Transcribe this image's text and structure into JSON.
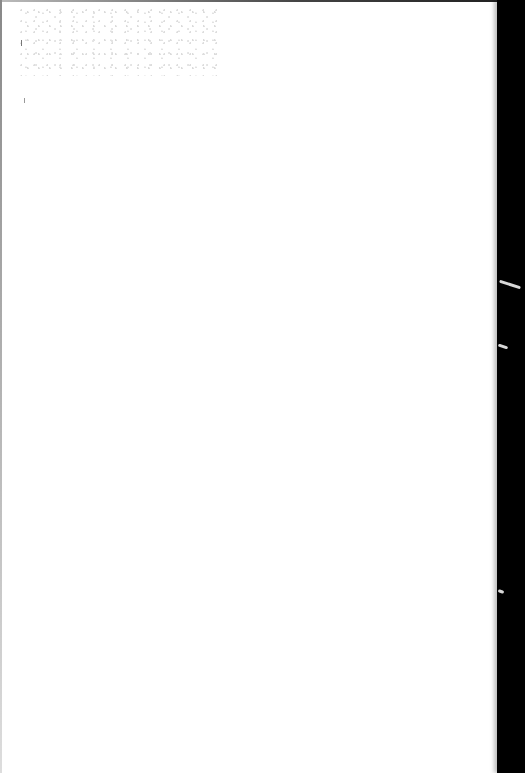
{
  "page": {
    "background_color": "#ffffff",
    "border_color": "#000000",
    "text_content": []
  }
}
